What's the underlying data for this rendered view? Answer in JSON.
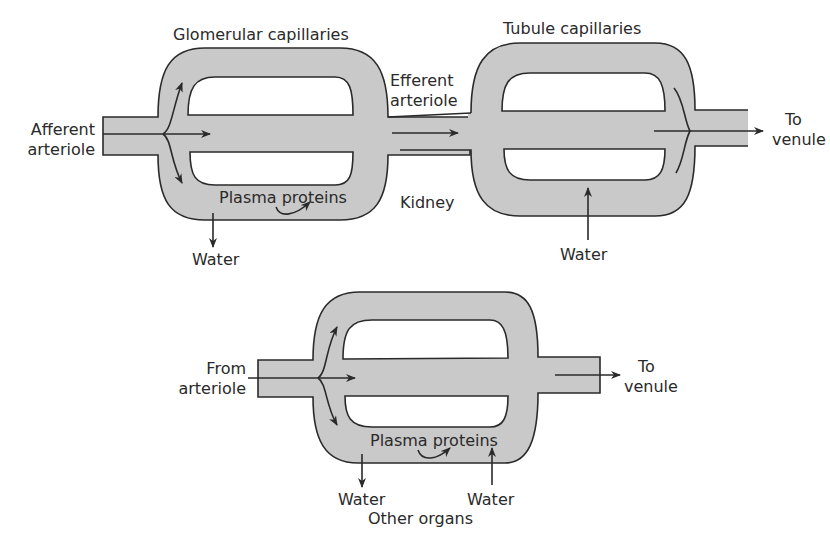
{
  "colors": {
    "fill": "#c9c9c9",
    "stroke": "#2a2a2a",
    "background": "#ffffff"
  },
  "kidney": {
    "region_label": "Kidney",
    "glomerular": {
      "title": "Glomerular capillaries",
      "inlet_label_1": "Afferent",
      "inlet_label_2": "arteriole",
      "proteins_label": "Plasma proteins",
      "water_out_label": "Water"
    },
    "efferent": {
      "label_1": "Efferent",
      "label_2": "arteriole"
    },
    "tubule": {
      "title": "Tubule capillaries",
      "water_in_label": "Water",
      "outlet_label_1": "To",
      "outlet_label_2": "venule"
    }
  },
  "other": {
    "region_label": "Other organs",
    "inlet_label_1": "From",
    "inlet_label_2": "arteriole",
    "outlet_label_1": "To",
    "outlet_label_2": "venule",
    "proteins_label": "Plasma proteins",
    "water_out_label": "Water",
    "water_in_label": "Water"
  }
}
